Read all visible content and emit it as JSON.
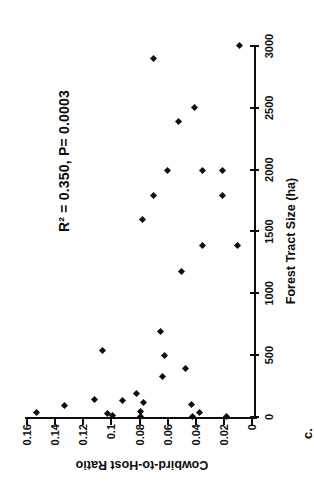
{
  "figure": {
    "panel_label": "c.",
    "background_color": "#ffffff",
    "ink_color": "#0d0d0d"
  },
  "chart_data": {
    "type": "scatter",
    "title": "",
    "annotation": "R² = 0.350, P= 0.0003",
    "xlabel": "Forest Tract Size (ha)",
    "ylabel": "Cowbird-to-Host Ratio",
    "xlim": [
      0,
      3000
    ],
    "ylim": [
      0,
      0.16
    ],
    "x_tick_values": [
      0,
      500,
      1000,
      1500,
      2000,
      2500,
      3000
    ],
    "x_tick_labels": [
      "0",
      "500",
      "1000",
      "1500",
      "2000",
      "2500",
      "3000"
    ],
    "y_tick_values": [
      0,
      0.02,
      0.04,
      0.06,
      0.08,
      0.1,
      0.12,
      0.14,
      0.16
    ],
    "y_tick_labels": [
      "0",
      "0.02",
      "0.04",
      "0.06",
      "0.08",
      "0.1",
      "0.12",
      "0.14",
      "0.16"
    ],
    "grid": false,
    "legend": false,
    "marker": "diamond",
    "orientation": "figure rotated 90 degrees counter-clockwise on page",
    "points": [
      [
        3000,
        0.009
      ],
      [
        2900,
        0.07
      ],
      [
        2500,
        0.041
      ],
      [
        2390,
        0.052
      ],
      [
        1990,
        0.06
      ],
      [
        1990,
        0.035
      ],
      [
        1990,
        0.021
      ],
      [
        1795,
        0.07
      ],
      [
        1795,
        0.021
      ],
      [
        1600,
        0.078
      ],
      [
        1385,
        0.035
      ],
      [
        1385,
        0.01
      ],
      [
        1180,
        0.05
      ],
      [
        690,
        0.065
      ],
      [
        535,
        0.106
      ],
      [
        500,
        0.062
      ],
      [
        390,
        0.047
      ],
      [
        330,
        0.064
      ],
      [
        190,
        0.082
      ],
      [
        130,
        0.092
      ],
      [
        115,
        0.077
      ],
      [
        145,
        0.112
      ],
      [
        25,
        0.103
      ],
      [
        15,
        0.099
      ],
      [
        45,
        0.079
      ],
      [
        0,
        0.079
      ],
      [
        105,
        0.043
      ],
      [
        40,
        0.037
      ],
      [
        0,
        0.042
      ],
      [
        0,
        0.018
      ],
      [
        40,
        0.153
      ],
      [
        90,
        0.133
      ]
    ]
  }
}
